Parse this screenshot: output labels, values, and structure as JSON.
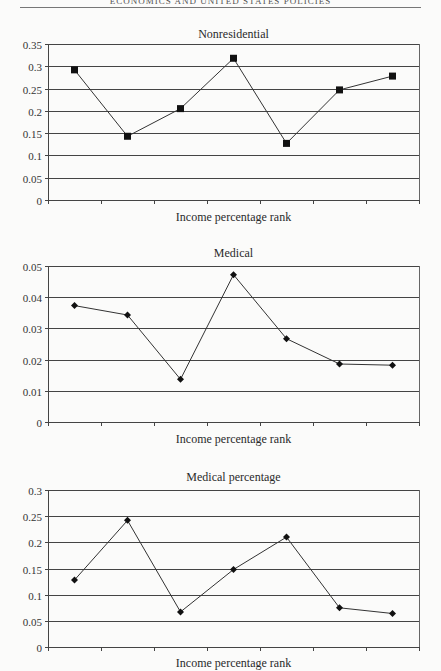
{
  "page": {
    "running_head": "ECONOMICS AND UNITED STATES POLICIES"
  },
  "chart_data": [
    {
      "type": "line",
      "title": "Nonresidential",
      "xlabel": "Income percentage rank",
      "ylabel": "",
      "x": [
        1,
        2,
        3,
        4,
        5,
        6,
        7
      ],
      "values": [
        0.292,
        0.143,
        0.205,
        0.318,
        0.127,
        0.247,
        0.278
      ],
      "yticks": [
        "0",
        "0.05",
        "0.1",
        "0.15",
        "0.2",
        "0.25",
        "0.3",
        "0.35"
      ],
      "ylim": [
        0,
        0.35
      ],
      "marker": "square",
      "grid": true,
      "layout": {
        "top": 44,
        "bottom": 200,
        "left": 48,
        "right": 419,
        "title_y": 38,
        "xlabel_y": 221
      }
    },
    {
      "type": "line",
      "title": "Medical",
      "xlabel": "Income percentage rank",
      "ylabel": "",
      "x": [
        1,
        2,
        3,
        4,
        5,
        6,
        7
      ],
      "values": [
        0.0373,
        0.0343,
        0.0137,
        0.0472,
        0.0267,
        0.0186,
        0.0182
      ],
      "yticks": [
        "0",
        "0.01",
        "0.02",
        "0.03",
        "0.04",
        "0.05"
      ],
      "ylim": [
        0,
        0.05
      ],
      "marker": "diamond",
      "grid": true,
      "layout": {
        "top": 266,
        "bottom": 422,
        "left": 48,
        "right": 419,
        "title_y": 257,
        "xlabel_y": 443
      }
    },
    {
      "type": "line",
      "title": "Medical percentage",
      "xlabel": "Income percentage rank",
      "ylabel": "",
      "x": [
        1,
        2,
        3,
        4,
        5,
        6,
        7
      ],
      "values": [
        0.128,
        0.242,
        0.067,
        0.148,
        0.21,
        0.075,
        0.064
      ],
      "yticks": [
        "0",
        "0.05",
        "0.1",
        "0.15",
        "0.2",
        "0.25",
        "0.3"
      ],
      "ylim": [
        0,
        0.3
      ],
      "marker": "diamond",
      "grid": true,
      "layout": {
        "top": 490,
        "bottom": 647,
        "left": 48,
        "right": 419,
        "title_y": 481,
        "xlabel_y": 667
      }
    }
  ]
}
